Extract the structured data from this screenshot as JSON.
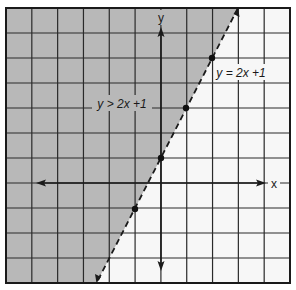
{
  "chart_data": {
    "type": "line",
    "title": "",
    "xlabel": "x",
    "ylabel": "y",
    "xlim": [
      -6,
      5
    ],
    "ylim": [
      -4,
      7
    ],
    "grid": true,
    "grid_spacing": 1,
    "boundary_line": {
      "equation": "y = 2x + 1",
      "slope": 2,
      "intercept": 1,
      "style": "dashed",
      "points": [
        {
          "x": -1,
          "y": -1
        },
        {
          "x": 0,
          "y": 1
        },
        {
          "x": 1,
          "y": 3
        },
        {
          "x": 2,
          "y": 5
        }
      ]
    },
    "shaded_region": {
      "inequality": "y > 2x + 1",
      "side": "above-left"
    },
    "annotations": [
      {
        "text": "y > 2x + 1",
        "x": -2.5,
        "y": 3
      },
      {
        "text": "y = 2x + 1",
        "x": 3,
        "y": 4
      }
    ]
  },
  "labels": {
    "x_axis": "x",
    "y_axis": "y",
    "inequality": "y > 2x +1",
    "equation": "y = 2x +1"
  },
  "colors": {
    "shade": "#b8b8b8",
    "background": "#f7f7f7",
    "grid": "#2a2a2a",
    "axis": "#1a1a1a"
  }
}
